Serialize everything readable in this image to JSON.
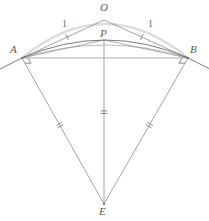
{
  "figure": {
    "kind": "geometry-diagram",
    "background": "#ffffff",
    "width": 209,
    "height": 221,
    "stroke_dark": "#6b6b6b",
    "stroke_mid": "#8c8c8c",
    "stroke_light": "#d8d8d8",
    "text_color": "#5a5a5a"
  },
  "points": {
    "O": {
      "label": "O",
      "x": 104,
      "y": 20,
      "label_x": 100,
      "label_y": 2
    },
    "P": {
      "label": "P",
      "x": 104,
      "y": 40,
      "label_x": 100,
      "label_y": 28
    },
    "A": {
      "label": "A",
      "x": 22,
      "y": 58,
      "label_x": 10,
      "label_y": 44
    },
    "B": {
      "label": "B",
      "x": 188,
      "y": 58,
      "label_x": 190,
      "label_y": 44
    },
    "E": {
      "label": "E",
      "x": 104,
      "y": 204,
      "label_x": 99,
      "label_y": 206
    }
  },
  "length_labels": [
    {
      "name": "segment-oa-length",
      "text": "1",
      "x": 62,
      "y": 19
    },
    {
      "name": "segment-ob-length",
      "text": "1",
      "x": 148,
      "y": 19
    }
  ],
  "segments": [
    {
      "name": "segment-oa",
      "from": "O",
      "to": "A",
      "stroke": "#8c8c8c",
      "width": 0.8
    },
    {
      "name": "segment-ob",
      "from": "O",
      "to": "B",
      "stroke": "#8c8c8c",
      "width": 0.8
    },
    {
      "name": "chord-ab",
      "from": "A",
      "to": "B",
      "stroke": "#9a9a9a",
      "width": 0.8
    },
    {
      "name": "segment-ap",
      "from": "A",
      "to": "P",
      "stroke": "#8c8c8c",
      "width": 0.7
    },
    {
      "name": "segment-pb",
      "from": "P",
      "to": "B",
      "stroke": "#8c8c8c",
      "width": 0.7
    },
    {
      "name": "segment-ae",
      "from": "A",
      "to": "E",
      "stroke": "#8c8c8c",
      "width": 0.8
    },
    {
      "name": "segment-be",
      "from": "B",
      "to": "E",
      "stroke": "#8c8c8c",
      "width": 0.8
    },
    {
      "name": "segment-pe-axis",
      "from": "P",
      "to": "E",
      "stroke": "#8c8c8c",
      "width": 0.8
    }
  ],
  "arcs": [
    {
      "name": "outer-arc-aob",
      "description": "light gray outer circular arc through A and B passing near O",
      "stroke": "#dcdcdc",
      "width": 2.4,
      "sag": 34
    },
    {
      "name": "arc-apb",
      "description": "dark circular arc from A through P to B",
      "stroke": "#6b6b6b",
      "width": 0.9,
      "sag": 18
    },
    {
      "name": "arc-apb-inner",
      "description": "second fainter arc from A to B slightly below the main arc",
      "stroke": "#9a9a9a",
      "width": 0.7,
      "sag": 13
    }
  ],
  "tangent_rays": [
    {
      "name": "tangent-ray-at-a",
      "through": "A",
      "dx": -22,
      "dy": 11,
      "stroke": "#6b6b6b",
      "width": 0.9
    },
    {
      "name": "tangent-ray-at-b",
      "through": "B",
      "dx": 22,
      "dy": 11,
      "stroke": "#6b6b6b",
      "width": 0.9
    }
  ],
  "right_angle_marks": [
    {
      "name": "right-angle-mark-a",
      "at": "A"
    },
    {
      "name": "right-angle-mark-b",
      "at": "B"
    }
  ],
  "tick_marks": [
    {
      "name": "tick-oa-single",
      "on": "segment-oa",
      "count": 1
    },
    {
      "name": "tick-ob-single",
      "on": "segment-ob",
      "count": 1
    },
    {
      "name": "tick-ae-double",
      "on": "segment-ae",
      "count": 2
    },
    {
      "name": "tick-be-double",
      "on": "segment-be",
      "count": 2
    },
    {
      "name": "tick-pe-double",
      "on": "segment-pe-axis",
      "count": 2
    }
  ]
}
